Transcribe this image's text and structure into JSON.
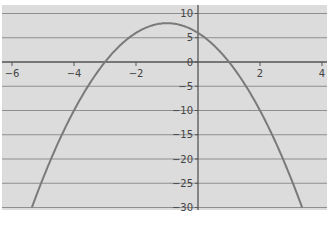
{
  "chart_data": {
    "type": "line",
    "title": "",
    "xlabel": "",
    "ylabel": "",
    "equation": "y = -2x^2 - 4x + 6",
    "xlim": [
      -6.2,
      4.1
    ],
    "ylim": [
      -31,
      11.5
    ],
    "grid": {
      "horizontal": true,
      "vertical": false
    },
    "legend": null,
    "x_ticks": [
      -6,
      -4,
      -2,
      2,
      4
    ],
    "x_tick_labels": [
      "−6",
      "−4",
      "−2",
      "2",
      "4"
    ],
    "y_ticks": [
      10,
      5,
      0,
      -5,
      -10,
      -15,
      -20,
      -25,
      -30
    ],
    "y_tick_labels": [
      "10",
      "5",
      "0",
      "−5",
      "−10",
      "−15",
      "−20",
      "−25",
      "−30"
    ],
    "series": [
      {
        "name": "parabola",
        "x": [
          -5.36,
          -5,
          -4,
          -3,
          -2,
          -1,
          0,
          1,
          2,
          3,
          3.36
        ],
        "y": [
          -30,
          -24,
          -10,
          0,
          6,
          8,
          6,
          0,
          -10,
          -24,
          -30
        ]
      }
    ],
    "annotations": {
      "vertex": [
        -1,
        8
      ],
      "y_intercept": 6,
      "roots": [
        -3,
        1
      ]
    }
  },
  "colors": {
    "plot_background": "#dcdcdc",
    "gridline": "#8f8f8f",
    "axis": "#555555",
    "curve": "#7a7a7a",
    "page_background": "#ffffff"
  }
}
